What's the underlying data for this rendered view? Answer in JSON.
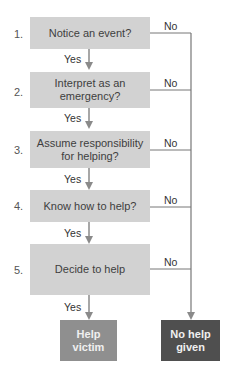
{
  "steps": [
    {
      "number": "1.",
      "label": "Notice an event?",
      "yes": "Yes",
      "no": "No"
    },
    {
      "number": "2.",
      "label": "Interpret as an emergency?",
      "yes": "Yes",
      "no": "No"
    },
    {
      "number": "3.",
      "label": "Assume responsibility for helping?",
      "yes": "Yes",
      "no": "No"
    },
    {
      "number": "4.",
      "label": "Know how to help?",
      "yes": "Yes",
      "no": "No"
    },
    {
      "number": "5.",
      "label": "Decide to help",
      "yes": "Yes",
      "no": "No"
    }
  ],
  "outcomes": {
    "help": {
      "label": "Help victim",
      "color": "#8f8f8f"
    },
    "no_help": {
      "label": "No help given",
      "color": "#4f4f4f"
    }
  },
  "colors": {
    "box_fill": "#d2d2d2",
    "line": "#888888"
  }
}
